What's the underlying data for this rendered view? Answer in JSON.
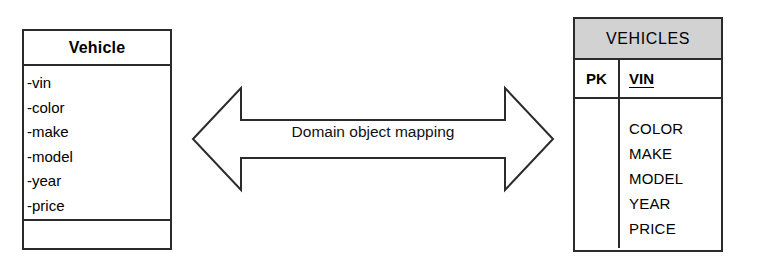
{
  "diagram": {
    "title": "Domain object mapping",
    "colors": {
      "stroke": "#2b2b2b",
      "header_fill": "#d2d2d2",
      "background": "#ffffff",
      "text": "#000000"
    }
  },
  "uml_class": {
    "name": "Vehicle",
    "attributes": [
      {
        "label": "-vin"
      },
      {
        "label": "-color"
      },
      {
        "label": "-make"
      },
      {
        "label": "-model"
      },
      {
        "label": "-year"
      },
      {
        "label": "-price"
      }
    ],
    "operations": []
  },
  "arrow": {
    "label": "Domain object mapping",
    "direction": "bidirectional",
    "icon": "double-headed-arrow-icon"
  },
  "db_table": {
    "name": "VEHICLES",
    "key_row": {
      "key_type": "PK",
      "key_column": "VIN"
    },
    "columns": [
      {
        "label": "COLOR"
      },
      {
        "label": "MAKE"
      },
      {
        "label": "MODEL"
      },
      {
        "label": "YEAR"
      },
      {
        "label": "PRICE"
      }
    ]
  }
}
